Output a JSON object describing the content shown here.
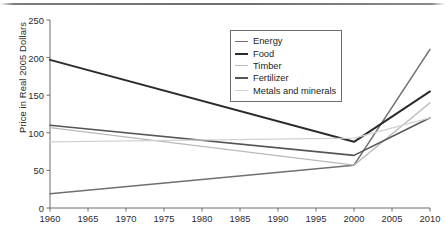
{
  "chart_data": {
    "type": "line",
    "title": "",
    "xlabel": "",
    "ylabel": "Price in Real 2005 Dollars",
    "x": [
      1960,
      2000,
      2010
    ],
    "xlim": [
      1960,
      2010
    ],
    "ylim": [
      0,
      250
    ],
    "xticks": [
      1960,
      1965,
      1970,
      1975,
      1980,
      1985,
      1990,
      1995,
      2000,
      2005,
      2010
    ],
    "yticks": [
      0,
      50,
      100,
      150,
      200,
      250
    ],
    "grid": false,
    "legend_position": "top-center-right",
    "series": [
      {
        "name": "Energy",
        "values": [
          19,
          57,
          211
        ],
        "color": "#6f6f6f"
      },
      {
        "name": "Food",
        "values": [
          197,
          88,
          155
        ],
        "color": "#2b2b2b"
      },
      {
        "name": "Timber",
        "values": [
          107,
          57,
          140
        ],
        "color": "#b9b9b9"
      },
      {
        "name": "Fertilizer",
        "values": [
          110,
          70,
          120
        ],
        "color": "#555555"
      },
      {
        "name": "Metals and minerals",
        "values": [
          88,
          93,
          120
        ],
        "color": "#d2d2d2"
      }
    ]
  },
  "axis": {
    "ylabel": "Price in Real 2005 Dollars",
    "yticks": [
      "250",
      "200",
      "150",
      "100",
      "50",
      "0"
    ],
    "xticks": [
      "1960",
      "1965",
      "1970",
      "1975",
      "1980",
      "1985",
      "1990",
      "1995",
      "2000",
      "2005",
      "2010"
    ]
  },
  "legend": {
    "items": [
      {
        "label": "Energy"
      },
      {
        "label": "Food"
      },
      {
        "label": "Timber"
      },
      {
        "label": "Fertilizer"
      },
      {
        "label": "Metals and minerals"
      }
    ]
  }
}
